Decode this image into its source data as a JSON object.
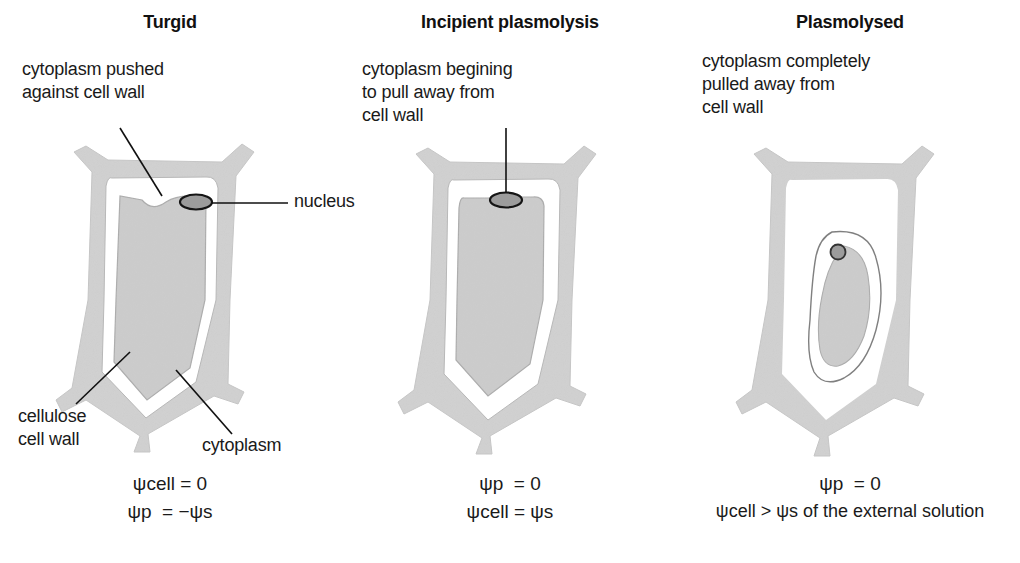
{
  "figure": {
    "background": "#ffffff",
    "colors": {
      "cell_wall": "#d2d2d2",
      "cell_wall_edge": "#c2c2c2",
      "vacuole": "#cfcfcf",
      "vacuole_edge": "#9a9a9a",
      "cytoplasm": "#ffffff",
      "nucleus_fill": "#9e9e9e",
      "nucleus_edge": "#1a1a1a",
      "text": "#1a1a1a",
      "leader_line": "#111111"
    }
  },
  "panels": [
    {
      "id": "turgid",
      "title": "Turgid",
      "description": "cytoplasm pushed\nagainst cell wall",
      "labels": {
        "nucleus": "nucleus",
        "cell_wall": "cellulose\ncell wall",
        "cytoplasm": "cytoplasm"
      },
      "formula_lines": [
        {
          "lhs": "ψ",
          "lhs_sub": "cell",
          "op": "=",
          "rhs": "0",
          "rhs_sub": ""
        },
        {
          "lhs": "ψ",
          "lhs_sub": "p",
          "op": "=",
          "rhs": "−ψ",
          "rhs_sub": "s"
        }
      ]
    },
    {
      "id": "incipient-plasmolysis",
      "title": "Incipient plasmolysis",
      "description": "cytoplasm begining\nto pull away from\ncell wall",
      "labels": {},
      "formula_lines": [
        {
          "lhs": "ψ",
          "lhs_sub": "p",
          "op": "=",
          "rhs": "0",
          "rhs_sub": ""
        },
        {
          "lhs": "ψ",
          "lhs_sub": "cell",
          "op": "=",
          "rhs": "ψ",
          "rhs_sub": "s"
        }
      ]
    },
    {
      "id": "plasmolysed",
      "title": "Plasmolysed",
      "description": "cytoplasm completely\npulled away from\ncell wall",
      "labels": {},
      "formula_lines": [
        {
          "lhs": "ψ",
          "lhs_sub": "p",
          "op": "=",
          "rhs": "0",
          "rhs_sub": ""
        },
        {
          "lhs": "ψ",
          "lhs_sub": "cell",
          "op": ">",
          "rhs": "ψ",
          "rhs_sub": "s",
          "suffix": " of the external solution"
        }
      ]
    }
  ],
  "formula_text": {
    "p1_line1": "ψcell = 0",
    "p1_line2": "ψp  = −ψs",
    "p2_line1": "ψp  = 0",
    "p2_line2": "ψcell = ψs",
    "p3_line1": "ψp  = 0",
    "p3_line2": "ψcell > ψs of the external solution"
  }
}
